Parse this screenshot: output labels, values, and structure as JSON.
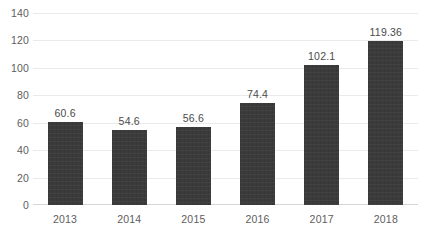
{
  "chart_data": {
    "type": "bar",
    "title": "",
    "subtitle": "",
    "xlabel": "",
    "ylabel": "",
    "categories": [
      "2013",
      "2014",
      "2015",
      "2016",
      "2017",
      "2018"
    ],
    "values": [
      60.6,
      54.6,
      56.6,
      74.4,
      102.1,
      119.36
    ],
    "data_labels": [
      "60.6",
      "54.6",
      "56.6",
      "74.4",
      "102.1",
      "119.36"
    ],
    "series": [
      {
        "name": "",
        "values": [
          60.6,
          54.6,
          56.6,
          74.4,
          102.1,
          119.36
        ]
      }
    ],
    "ylim": [
      0,
      140
    ],
    "ytick_values": [
      0,
      20,
      40,
      60,
      80,
      100,
      120,
      140
    ],
    "ytick_labels": [
      "0",
      "20",
      "40",
      "60",
      "80",
      "100",
      "120",
      "140"
    ],
    "grid": true,
    "grid_axis": "y",
    "legend": false,
    "legend_position": "none",
    "colors": {
      "bar": "#3b3b3b",
      "gridline": "#eaeaea",
      "axis_line": "#d6d6d6",
      "tick_text": "#5d5d5d",
      "label_text": "#4a4a4a",
      "background": "#ffffff"
    }
  }
}
